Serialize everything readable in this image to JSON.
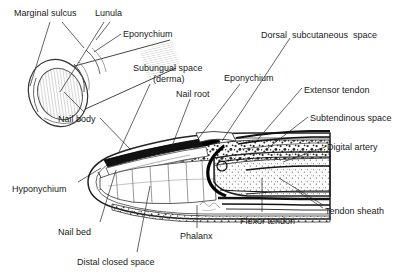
{
  "figure": {
    "view_left": "oblique fingertip view",
    "view_main": "sagittal section",
    "background_color": "#ffffff",
    "ink_color": "#1a1a1a",
    "signature": "artist signature"
  },
  "labels": [
    {
      "id": "marginal-sulcus",
      "text": "Marginal sulcus",
      "x": 14,
      "y": 8,
      "align": "left"
    },
    {
      "id": "lunula",
      "text": "Lunula",
      "x": 95,
      "y": 8,
      "align": "left"
    },
    {
      "id": "eponychium-top",
      "text": "Eponychium",
      "x": 123,
      "y": 29,
      "align": "left"
    },
    {
      "id": "subungual-space",
      "text": "Subungual space",
      "x": 133,
      "y": 63,
      "align": "left"
    },
    {
      "id": "subungual-space-derma",
      "text": "(derma)",
      "x": 153,
      "y": 74,
      "align": "left"
    },
    {
      "id": "nail-root",
      "text": "Nail root",
      "x": 176,
      "y": 89,
      "align": "left"
    },
    {
      "id": "eponychium-mid",
      "text": "Eponychium",
      "x": 224,
      "y": 73,
      "align": "left"
    },
    {
      "id": "dorsal-subcutaneous-space",
      "text": "Dorsal  subcutaneous  space",
      "x": 261,
      "y": 30,
      "align": "left"
    },
    {
      "id": "extensor-tendon",
      "text": "Extensor tendon",
      "x": 304,
      "y": 85,
      "align": "left"
    },
    {
      "id": "subtendinous-space",
      "text": "Subtendinous space",
      "x": 310,
      "y": 113,
      "align": "left"
    },
    {
      "id": "digital-artery",
      "text": "Digital artery",
      "x": 327,
      "y": 142,
      "align": "left"
    },
    {
      "id": "tendon-sheath",
      "text": "Tendon sheath",
      "x": 325,
      "y": 206,
      "align": "left"
    },
    {
      "id": "flexor-tendon",
      "text": "Flexor tendon",
      "x": 240,
      "y": 216,
      "align": "left"
    },
    {
      "id": "phalanx",
      "text": "Phalanx",
      "x": 180,
      "y": 231,
      "align": "left"
    },
    {
      "id": "distal-closed-space",
      "text": "Distal closed space",
      "x": 77,
      "y": 257,
      "align": "left"
    },
    {
      "id": "nail-bed",
      "text": "Nail bed",
      "x": 58,
      "y": 227,
      "align": "left"
    },
    {
      "id": "hyponychium",
      "text": "Hyponychium",
      "x": 12,
      "y": 184,
      "align": "left"
    },
    {
      "id": "nail-body",
      "text": "Nail body",
      "x": 58,
      "y": 114,
      "align": "left"
    }
  ],
  "leaders": [
    {
      "id": "leader-marginal-sulcus-a",
      "from": [
        50,
        22
      ],
      "to": [
        30,
        86
      ]
    },
    {
      "id": "leader-marginal-sulcus-b",
      "from": [
        62,
        22
      ],
      "to": [
        84,
        48
      ]
    },
    {
      "id": "leader-lunula",
      "from": [
        104,
        22
      ],
      "to": [
        60,
        92
      ]
    },
    {
      "id": "leader-lunula-b",
      "from": [
        110,
        22
      ],
      "to": [
        96,
        40
      ]
    },
    {
      "id": "leader-eponychium-top",
      "from": [
        121,
        34
      ],
      "to": [
        94,
        52
      ]
    },
    {
      "id": "leader-nail-body",
      "from": [
        84,
        112
      ],
      "to": [
        64,
        92
      ]
    },
    {
      "id": "leader-nail-body-2",
      "from": [
        100,
        118
      ],
      "to": [
        131,
        150
      ]
    },
    {
      "id": "leader-subungual",
      "from": [
        150,
        84
      ],
      "to": [
        119,
        152
      ]
    },
    {
      "id": "leader-nail-root",
      "from": [
        190,
        99
      ],
      "to": [
        172,
        146
      ]
    },
    {
      "id": "leader-eponychium-mid",
      "from": [
        240,
        84
      ],
      "to": [
        198,
        139
      ]
    },
    {
      "id": "leader-dorsal-sub",
      "from": [
        290,
        38
      ],
      "to": [
        222,
        141
      ]
    },
    {
      "id": "leader-extensor",
      "from": [
        302,
        88
      ],
      "to": [
        258,
        139
      ]
    },
    {
      "id": "leader-subtendinous",
      "from": [
        308,
        117
      ],
      "to": [
        268,
        148
      ]
    },
    {
      "id": "leader-digital-artery",
      "from": [
        325,
        147
      ],
      "to": [
        283,
        162
      ]
    },
    {
      "id": "leader-tendon-sheath",
      "from": [
        323,
        205
      ],
      "to": [
        279,
        178
      ]
    },
    {
      "id": "leader-tendon-sheath-2",
      "from": [
        323,
        208
      ],
      "to": [
        296,
        190
      ]
    },
    {
      "id": "leader-flexor",
      "from": [
        262,
        212
      ],
      "to": [
        262,
        178
      ]
    },
    {
      "id": "leader-phalanx",
      "from": [
        197,
        228
      ],
      "to": [
        197,
        205
      ]
    },
    {
      "id": "leader-distal-closed",
      "from": [
        137,
        252
      ],
      "to": [
        150,
        186
      ]
    },
    {
      "id": "leader-nail-bed",
      "from": [
        100,
        222
      ],
      "to": [
        116,
        170
      ]
    },
    {
      "id": "leader-hyponychium",
      "from": [
        78,
        182
      ],
      "to": [
        101,
        168
      ]
    }
  ]
}
